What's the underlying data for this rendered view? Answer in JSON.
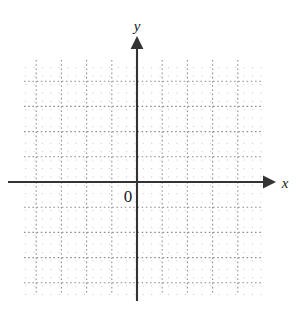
{
  "figure": {
    "type": "coordinate-plane",
    "width": 301,
    "height": 312,
    "background_color": "#ffffff"
  },
  "chart_data": {
    "type": "scatter",
    "title": "",
    "subtitle": "",
    "xlabel": "x",
    "ylabel": "y",
    "series": [
      {
        "name": "",
        "x": [],
        "y": []
      }
    ],
    "x": [],
    "values": [],
    "categories": [],
    "annotations": [
      "0"
    ],
    "legend": [],
    "legend_position": "none",
    "grid": true,
    "grid_style": "dotted",
    "grid_minor_spacing": 8.4,
    "grid_major_spacing": 25.2,
    "grid_major_columns": 9,
    "grid_major_rows": 9,
    "grid_left": 24,
    "grid_top": 60,
    "grid_right": 262,
    "grid_bottom": 295,
    "xlim": [
      -4.5,
      5.0
    ],
    "ylim": [
      -4.5,
      4.9
    ],
    "xtick_labels": [],
    "ytick_labels": [],
    "origin_label": "0",
    "axis_color": "#333333",
    "grid_color": "#9a9a9a",
    "grid_minor_color": "#c9c9c9"
  },
  "axes": {
    "x_axis": {
      "label": "x",
      "name": "x-axis",
      "y_position": 182,
      "x_start": 8,
      "x_end": 272,
      "arrow": "right",
      "label_x": 285,
      "label_y": 188
    },
    "y_axis": {
      "label": "y",
      "name": "y-axis",
      "x_position": 137,
      "y_start": 301,
      "y_end": 40,
      "arrow": "up",
      "label_x": 131,
      "label_y": 31
    },
    "origin": {
      "label": "0",
      "x": 137,
      "y": 182,
      "label_x": 126,
      "label_y": 201
    }
  }
}
